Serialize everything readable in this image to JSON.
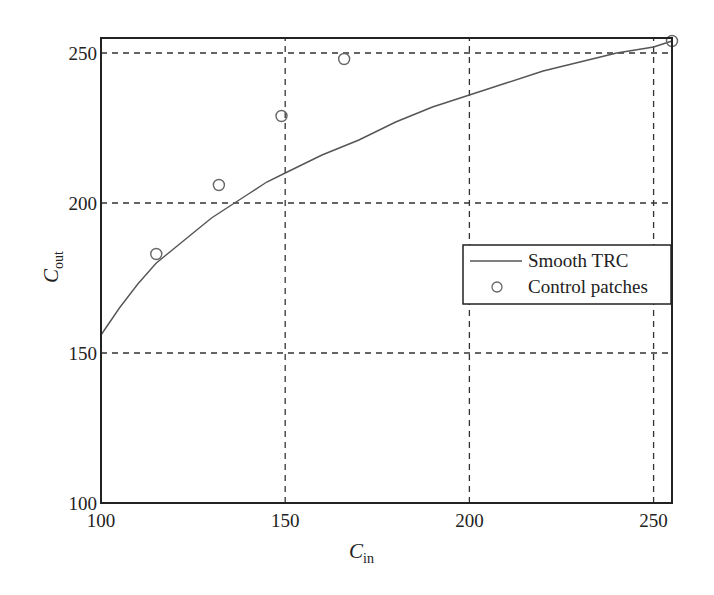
{
  "chart_data": {
    "type": "line",
    "title": "",
    "xlabel": "C_in",
    "ylabel": "C_out",
    "xlabel_main": "C",
    "xlabel_sub": "in",
    "ylabel_main": "C",
    "ylabel_sub": "out",
    "xlim": [
      100,
      255
    ],
    "ylim": [
      100,
      255
    ],
    "xticks": [
      100,
      150,
      200,
      250
    ],
    "yticks": [
      100,
      150,
      200,
      250
    ],
    "xtick_labels": [
      "100",
      "150",
      "200",
      "250"
    ],
    "ytick_labels": [
      "100",
      "150",
      "200",
      "250"
    ],
    "grid": true,
    "grid_style": "dashed",
    "legend_position": "center right",
    "series": [
      {
        "name": "Smooth TRC",
        "style": "line",
        "x": [
          100,
          105,
          110,
          115,
          120,
          125,
          130,
          135,
          140,
          145,
          150,
          160,
          170,
          180,
          190,
          200,
          210,
          220,
          230,
          240,
          250,
          255
        ],
        "y": [
          156,
          165,
          173,
          180,
          185,
          190,
          195,
          199,
          203,
          207,
          210,
          216,
          221,
          227,
          232,
          236,
          240,
          244,
          247,
          250,
          252,
          254
        ]
      },
      {
        "name": "Control patches",
        "style": "marker-circle",
        "x": [
          115,
          132,
          149,
          166,
          255
        ],
        "y": [
          183,
          206,
          229,
          248,
          254
        ]
      }
    ]
  },
  "legend": {
    "items": [
      {
        "label": "Smooth TRC",
        "symbol": "line"
      },
      {
        "label": "Control patches",
        "symbol": "circle"
      }
    ]
  },
  "colors": {
    "axis": "#222222",
    "grid": "#333333",
    "line": "#555555",
    "marker": "#666666"
  }
}
